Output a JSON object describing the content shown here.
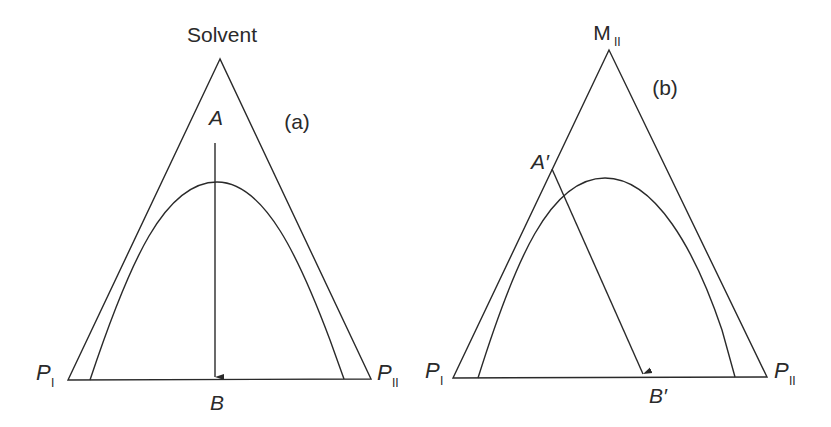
{
  "figure": {
    "panel_a": {
      "tag": "(a)",
      "apex_label": "Solvent",
      "point_start": "A",
      "point_end": "B",
      "left_vertex": {
        "main": "P",
        "sub": "I"
      },
      "right_vertex": {
        "main": "P",
        "sub": "II"
      },
      "description": "Ternary diagram: vertical path from A (solvent-rich) through binodal curve to B on the P_I–P_II base"
    },
    "panel_b": {
      "tag": "(b)",
      "apex_label": {
        "main": "M",
        "sub": "II"
      },
      "point_start": "A′",
      "point_end": "B′",
      "left_vertex": {
        "main": "P",
        "sub": "I"
      },
      "right_vertex": {
        "main": "P",
        "sub": "II"
      },
      "description": "Ternary diagram: path from A′ on left edge, crossing binodal curve, to B′ on base"
    },
    "colors": {
      "stroke": "#2a2a2a",
      "background": "#ffffff"
    }
  }
}
